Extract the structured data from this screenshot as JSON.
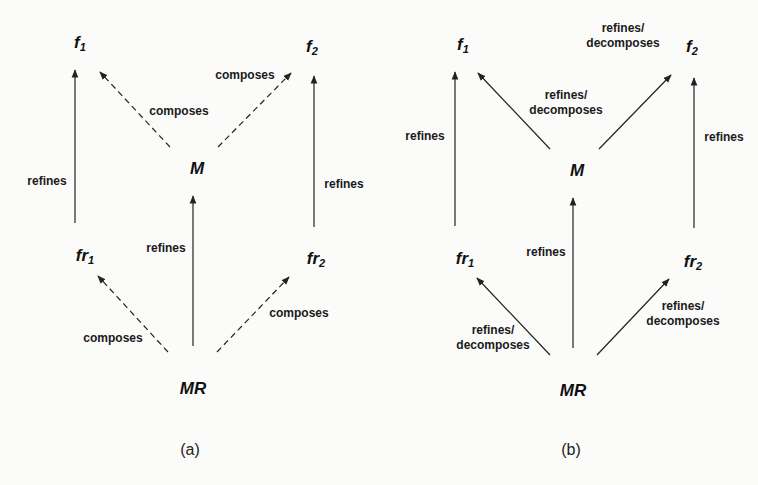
{
  "diagrams": [
    {
      "caption": "(a)",
      "nodes": {
        "f1": {
          "base": "f",
          "sub": "1"
        },
        "f2": {
          "base": "f",
          "sub": "2"
        },
        "M": {
          "base": "M",
          "sub": ""
        },
        "fr1": {
          "base": "fr",
          "sub": "1"
        },
        "fr2": {
          "base": "fr",
          "sub": "2"
        },
        "MR": {
          "base": "MR",
          "sub": ""
        }
      },
      "edges": [
        {
          "from": "fr1",
          "to": "f1",
          "label": "refines",
          "style": "solid"
        },
        {
          "from": "M",
          "to": "f1",
          "label": "composes",
          "style": "dashed"
        },
        {
          "from": "M",
          "to": "f2",
          "label": "composes",
          "style": "dashed"
        },
        {
          "from": "fr2",
          "to": "f2",
          "label": "refines",
          "style": "solid"
        },
        {
          "from": "MR",
          "to": "M",
          "label": "refines",
          "style": "solid"
        },
        {
          "from": "MR",
          "to": "fr1",
          "label": "composes",
          "style": "dashed"
        },
        {
          "from": "MR",
          "to": "fr2",
          "label": "composes",
          "style": "dashed"
        }
      ]
    },
    {
      "caption": "(b)",
      "nodes": {
        "f1": {
          "base": "f",
          "sub": "1"
        },
        "f2": {
          "base": "f",
          "sub": "2"
        },
        "M": {
          "base": "M",
          "sub": ""
        },
        "fr1": {
          "base": "fr",
          "sub": "1"
        },
        "fr2": {
          "base": "fr",
          "sub": "2"
        },
        "MR": {
          "base": "MR",
          "sub": ""
        }
      },
      "edges": [
        {
          "from": "fr1",
          "to": "f1",
          "label": "refines",
          "style": "solid"
        },
        {
          "from": "M",
          "to": "f1",
          "label": "refines/\ndecomposes",
          "label_line1": "refines/",
          "label_line2": "decomposes",
          "style": "solid"
        },
        {
          "from": "M",
          "to": "f2",
          "label": "refines/\ndecomposes",
          "label_line1": "refines/",
          "label_line2": "decomposes",
          "style": "solid"
        },
        {
          "from": "fr2",
          "to": "f2",
          "label": "refines",
          "style": "solid"
        },
        {
          "from": "MR",
          "to": "M",
          "label": "refines",
          "style": "solid"
        },
        {
          "from": "MR",
          "to": "fr1",
          "label": "refines/\ndecomposes",
          "label_line1": "refines/",
          "label_line2": "decomposes",
          "style": "solid"
        },
        {
          "from": "MR",
          "to": "fr2",
          "label": "refines/\ndecomposes",
          "label_line1": "refines/",
          "label_line2": "decomposes",
          "style": "solid"
        }
      ]
    }
  ],
  "colors": {
    "line": "#222222",
    "background": "#fbfbfa",
    "text": "#111111"
  }
}
